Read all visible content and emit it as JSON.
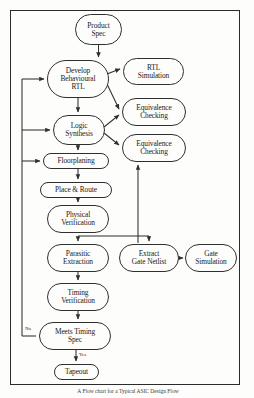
{
  "figure": {
    "caption": "A Flow chart for a Typical ASIC Design Flow",
    "border_color": "#2b2b2b",
    "node_border_color": "#2f2f2f",
    "line_color": "#2f2f2f",
    "background": "#fdfdfc"
  },
  "nodes": [
    {
      "id": "product-spec",
      "label": "Product\nSpec",
      "lines": [
        "Product",
        "Spec"
      ],
      "x": 75,
      "y": 14,
      "w": 47,
      "h": 31,
      "font": 7.4
    },
    {
      "id": "develop-behavioural-rtl",
      "label": "Develop\nBehavioural\nRTL",
      "lines": [
        "Develop",
        "Behavioural",
        "RTL"
      ],
      "x": 47,
      "y": 60,
      "w": 62,
      "h": 38,
      "font": 7.4
    },
    {
      "id": "rtl-simulation",
      "label": "RTL\nSimulation",
      "lines": [
        "RTL",
        "Simulation"
      ],
      "x": 123,
      "y": 58,
      "w": 61,
      "h": 27,
      "font": 7.4
    },
    {
      "id": "equivalence-checking-1",
      "label": "Equivalence\nChecking",
      "lines": [
        "Equivalence",
        "Checking"
      ],
      "x": 122,
      "y": 98,
      "w": 64,
      "h": 28,
      "font": 7.4
    },
    {
      "id": "logic-synthesis",
      "label": "Logic\nSynthesis",
      "lines": [
        "Logic",
        "Synthesis"
      ],
      "x": 53,
      "y": 115,
      "w": 52,
      "h": 30,
      "font": 7.4
    },
    {
      "id": "equivalence-checking-2",
      "label": "Equivalence\nChecking",
      "lines": [
        "Equivalence",
        "Checking"
      ],
      "x": 122,
      "y": 134,
      "w": 64,
      "h": 28,
      "font": 7.4
    },
    {
      "id": "floorplaning",
      "label": "Floorplaning",
      "lines": [
        "Floorplaning"
      ],
      "x": 43,
      "y": 153,
      "w": 66,
      "h": 16,
      "font": 7.4
    },
    {
      "id": "place-and-route",
      "label": "Place & Route",
      "lines": [
        "Place & Route"
      ],
      "x": 40,
      "y": 182,
      "w": 72,
      "h": 16,
      "font": 7.4
    },
    {
      "id": "physical-verification",
      "label": "Physical\nVerification",
      "lines": [
        "Physical",
        "Verification"
      ],
      "x": 47,
      "y": 205,
      "w": 62,
      "h": 28,
      "font": 7.4
    },
    {
      "id": "parasitic-extraction",
      "label": "Parasitic\nExtraction",
      "lines": [
        "Parasitic",
        "Extraction"
      ],
      "x": 47,
      "y": 244,
      "w": 62,
      "h": 28,
      "font": 7.4
    },
    {
      "id": "extract-gate-netlist",
      "label": "Extract\nGate Netlist",
      "lines": [
        "Extract",
        "Gate Netlist"
      ],
      "x": 119,
      "y": 244,
      "w": 60,
      "h": 28,
      "font": 7.4
    },
    {
      "id": "gate-simulation",
      "label": "Gate\nSimulation",
      "lines": [
        "Gate",
        "Simulation"
      ],
      "x": 185,
      "y": 244,
      "w": 52,
      "h": 28,
      "font": 7.4
    },
    {
      "id": "timing-verification",
      "label": "Timing\nVerification",
      "lines": [
        "Timing",
        "Verification"
      ],
      "x": 47,
      "y": 283,
      "w": 62,
      "h": 28,
      "font": 7.4
    },
    {
      "id": "meets-timing-spec",
      "label": "Meets Timing\nSpec",
      "lines": [
        "Meets Timing",
        "Spec"
      ],
      "x": 39,
      "y": 322,
      "w": 72,
      "h": 28,
      "font": 7.4
    },
    {
      "id": "tapeout",
      "label": "Tapeout",
      "lines": [
        "Tapeout"
      ],
      "x": 54,
      "y": 364,
      "w": 45,
      "h": 16,
      "font": 7.4
    }
  ],
  "edge_labels": [
    {
      "id": "no-label",
      "text": "No",
      "x": 25,
      "y": 326
    },
    {
      "id": "yes-label",
      "text": "Yes",
      "x": 79,
      "y": 352
    }
  ]
}
